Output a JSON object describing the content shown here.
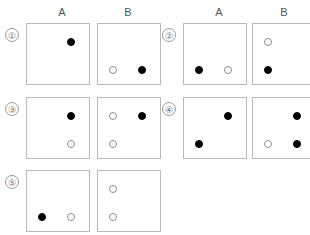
{
  "headers": [
    {
      "label": "A",
      "x": 52,
      "y": 6
    },
    {
      "label": "B",
      "x": 118,
      "y": 6
    },
    {
      "label": "A",
      "x": 209,
      "y": 6
    },
    {
      "label": "B",
      "x": 274,
      "y": 6
    }
  ],
  "geometry": {
    "panel_width": 64,
    "panel_height": 62,
    "columns_x": [
      26,
      97,
      183,
      252
    ],
    "rows_y": [
      23,
      97,
      170
    ],
    "dot_positions": {
      "top_left": {
        "x": 15,
        "y": 18
      },
      "top_right": {
        "x": 44,
        "y": 18
      },
      "bottom_left": {
        "x": 15,
        "y": 46
      },
      "bottom_right": {
        "x": 44,
        "y": 46
      }
    }
  },
  "items": [
    {
      "number": "①",
      "number_x": 5,
      "number_y": 28,
      "row": 0,
      "col_pair": 0,
      "panels": [
        {
          "column": "A",
          "dots": [
            {
              "pos": "top_right",
              "fill": "filled"
            }
          ]
        },
        {
          "column": "B",
          "dots": [
            {
              "pos": "bottom_left",
              "fill": "open"
            },
            {
              "pos": "bottom_right",
              "fill": "filled"
            }
          ]
        }
      ]
    },
    {
      "number": "②",
      "number_x": 162,
      "number_y": 28,
      "row": 0,
      "col_pair": 1,
      "panels": [
        {
          "column": "A",
          "dots": [
            {
              "pos": "bottom_left",
              "fill": "filled"
            },
            {
              "pos": "bottom_right",
              "fill": "open"
            }
          ]
        },
        {
          "column": "B",
          "dots": [
            {
              "pos": "top_left",
              "fill": "open"
            },
            {
              "pos": "bottom_left",
              "fill": "filled"
            }
          ]
        }
      ]
    },
    {
      "number": "③",
      "number_x": 5,
      "number_y": 102,
      "row": 1,
      "col_pair": 0,
      "panels": [
        {
          "column": "A",
          "dots": [
            {
              "pos": "top_right",
              "fill": "filled"
            },
            {
              "pos": "bottom_right",
              "fill": "open"
            }
          ]
        },
        {
          "column": "B",
          "dots": [
            {
              "pos": "top_left",
              "fill": "open"
            },
            {
              "pos": "top_right",
              "fill": "filled"
            },
            {
              "pos": "bottom_left",
              "fill": "open"
            }
          ]
        }
      ]
    },
    {
      "number": "④",
      "number_x": 162,
      "number_y": 102,
      "row": 1,
      "col_pair": 1,
      "panels": [
        {
          "column": "A",
          "dots": [
            {
              "pos": "top_right",
              "fill": "filled"
            },
            {
              "pos": "bottom_left",
              "fill": "filled"
            }
          ]
        },
        {
          "column": "B",
          "dots": [
            {
              "pos": "top_right",
              "fill": "filled"
            },
            {
              "pos": "bottom_left",
              "fill": "open"
            },
            {
              "pos": "bottom_right",
              "fill": "filled"
            }
          ]
        }
      ]
    },
    {
      "number": "⑤",
      "number_x": 5,
      "number_y": 175,
      "row": 2,
      "col_pair": 0,
      "panels": [
        {
          "column": "A",
          "dots": [
            {
              "pos": "bottom_left",
              "fill": "filled"
            },
            {
              "pos": "bottom_right",
              "fill": "open"
            }
          ]
        },
        {
          "column": "B",
          "dots": [
            {
              "pos": "top_left",
              "fill": "open"
            },
            {
              "pos": "bottom_left",
              "fill": "open"
            }
          ]
        }
      ]
    }
  ],
  "colors": {
    "panel_border": "#b9b9b9",
    "filled_dot": "#000000",
    "open_dot_border": "#8d8d8d",
    "open_dot_fill": "#ffffff",
    "text": "#555555",
    "number_border": "#9a9a9a",
    "background": "#ffffff"
  }
}
